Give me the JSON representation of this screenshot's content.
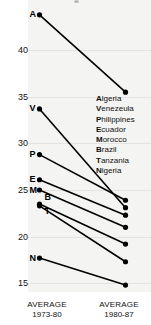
{
  "chart_data": {
    "type": "line",
    "subtype": "slopegraph",
    "title": "",
    "xlabel": "",
    "ylabel": "",
    "categories": [
      "AVERAGE 1973-80",
      "AVERAGE 1980-87"
    ],
    "ylim": [
      13.5,
      44.5
    ],
    "yticks": [
      40,
      35,
      30,
      25,
      20,
      15
    ],
    "ytick_labels": [
      "40",
      "35",
      "30",
      "25",
      "20",
      "15"
    ],
    "grid": true,
    "legend_position": "inside-right",
    "series": [
      {
        "name": "Algeria",
        "marker": "A",
        "values": [
          43.8,
          35.5
        ]
      },
      {
        "name": "Venezuela",
        "marker": "V",
        "values": [
          33.7,
          23.1
        ]
      },
      {
        "name": "Philippines",
        "marker": "P",
        "values": [
          28.8,
          23.9
        ]
      },
      {
        "name": "Ecuador",
        "marker": "E",
        "values": [
          26.1,
          22.3
        ]
      },
      {
        "name": "Morocco",
        "marker": "M",
        "values": [
          25.0,
          21.0
        ]
      },
      {
        "name": "Brazil",
        "marker": "B",
        "values": [
          23.5,
          19.2
        ]
      },
      {
        "name": "Tanzania",
        "marker": "T",
        "values": [
          23.3,
          17.3
        ]
      },
      {
        "name": "Nigeria",
        "marker": "N",
        "values": [
          17.7,
          14.8
        ]
      }
    ]
  },
  "axis": {
    "ticks": [
      {
        "label": "40"
      },
      {
        "label": "35"
      },
      {
        "label": "30"
      },
      {
        "label": "25"
      },
      {
        "label": "20"
      },
      {
        "label": "15"
      }
    ],
    "left_caption_line1": "AVERAGE",
    "left_caption_line2": "1973-80",
    "right_caption_line1": "AVERAGE",
    "right_caption_line2": "1980-87"
  },
  "markers": {
    "algeria": "A",
    "venezuela": "V",
    "philippines": "P",
    "ecuador": "E",
    "morocco": "M",
    "brazil": "B",
    "tanzania": "T",
    "nigeria": "N"
  },
  "legend": {
    "items": [
      {
        "name": "Algeria",
        "initial": "A",
        "rest": "lgeria"
      },
      {
        "name": "Venezuela",
        "initial": "V",
        "rest": "enezeula"
      },
      {
        "name": "Philippines",
        "initial": "P",
        "rest": "hilippines"
      },
      {
        "name": "Ecuador",
        "initial": "E",
        "rest": "cuador"
      },
      {
        "name": "Morocco",
        "initial": "M",
        "rest": "orocco"
      },
      {
        "name": "Brazil",
        "initial": "B",
        "rest": "razil"
      },
      {
        "name": "Tanzania",
        "initial": "T",
        "rest": "anzania"
      },
      {
        "name": "Nigeria",
        "initial": "N",
        "rest": "igeria"
      }
    ]
  },
  "colors": {
    "line": "#000000",
    "marker": "#000000",
    "plot_background": "#f4f4f2",
    "gridline": "#e3e3df",
    "text": "#111111"
  }
}
